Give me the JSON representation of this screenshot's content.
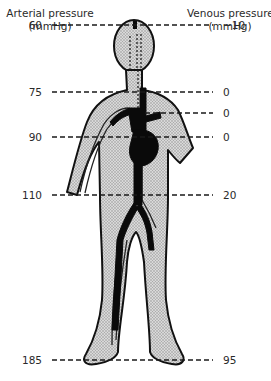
{
  "figure": {
    "left_header": {
      "line1": "Arterial pressure",
      "line2": "(mmHg)"
    },
    "right_header": {
      "line1": "Venous pressure",
      "line2": "(mmHg)"
    },
    "levels": [
      {
        "position": "head-top",
        "arterial": "60",
        "venous": "−10"
      },
      {
        "position": "neck",
        "arterial": "75",
        "venous": "0"
      },
      {
        "position": "clavicle",
        "arterial": "",
        "venous": "0"
      },
      {
        "position": "heart",
        "arterial": "90",
        "venous": "0"
      },
      {
        "position": "abdomen",
        "arterial": "110",
        "venous": "20"
      },
      {
        "position": "feet",
        "arterial": "185",
        "venous": "95"
      }
    ],
    "colors": {
      "body_fill": "#c9c9c9",
      "outline": "#111111",
      "artery": "#0a0a0a",
      "dash": "#1a1a1a",
      "text": "#2a2a2a"
    }
  }
}
